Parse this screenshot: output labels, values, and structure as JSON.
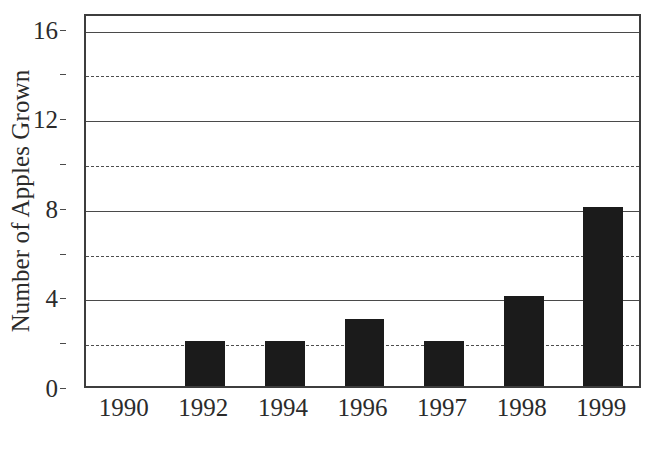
{
  "chart_data": {
    "type": "bar",
    "title": "",
    "subtitle": "",
    "xlabel": "",
    "ylabel": "Number of Apples Grown",
    "categories": [
      "1990",
      "1992",
      "1994",
      "1996",
      "1997",
      "1998",
      "1999"
    ],
    "values": [
      0,
      2,
      2,
      3,
      2,
      4,
      8
    ],
    "series": [
      {
        "name": "Number of Apples Grown",
        "values": [
          0,
          2,
          2,
          3,
          2,
          4,
          8
        ]
      }
    ],
    "ylim": [
      0,
      16.7
    ],
    "xlim_categories": 7,
    "y_major_ticks": [
      0,
      4,
      8,
      12,
      16
    ],
    "y_major_tick_labels": [
      "0",
      "4",
      "8",
      "12",
      "16"
    ],
    "y_minor_gridlines": [
      2,
      6,
      10,
      14
    ],
    "grid": {
      "horizontal_major": "solid",
      "horizontal_minor": "dashed",
      "vertical": "none"
    },
    "legend": {
      "visible": false,
      "position": "none",
      "entries": []
    },
    "annotations": [],
    "bar_color": "#1b1b1b",
    "background_color": "#ffffff",
    "axis_color": "#3d3d3d",
    "gridline_color": "#4a4a4a",
    "text_color": "#2b2b2b",
    "bar_width_ratio": 0.5
  }
}
